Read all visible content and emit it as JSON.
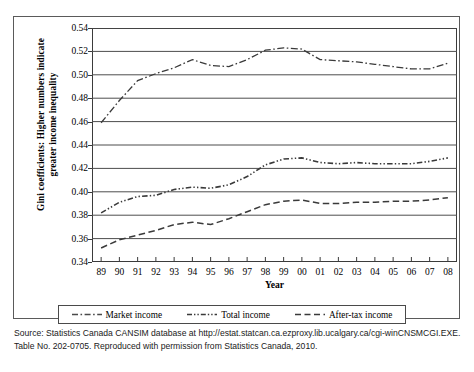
{
  "figure": {
    "y_axis_title_line1": "Gini coefficients: Higher numbers indicate",
    "y_axis_title_line2": "greater income inequality",
    "x_axis_title": "Year",
    "source_note": "Source: Statistics Canada CANSIM database at http://estat.statcan.ca.ezproxy.lib.ucalgary.ca/cgi-winCNSMCGI.EXE. Table No. 202-0705. Reproduced with permission from Statistics Canada, 2010."
  },
  "legend": {
    "items": [
      {
        "label": "Market income",
        "style": "dash-dot"
      },
      {
        "label": "Total income",
        "style": "dash-dot-dot"
      },
      {
        "label": "After-tax income",
        "style": "dash"
      }
    ]
  },
  "chart_data": {
    "type": "line",
    "title": "",
    "xlabel": "Year",
    "ylabel": "Gini coefficients: Higher numbers indicate greater income inequality",
    "categories": [
      "89",
      "90",
      "91",
      "92",
      "93",
      "94",
      "95",
      "96",
      "97",
      "98",
      "99",
      "00",
      "01",
      "02",
      "03",
      "04",
      "05",
      "06",
      "07",
      "08"
    ],
    "ylim": [
      0.34,
      0.54
    ],
    "yticks": [
      "0.34",
      "0.36",
      "0.38",
      "0.40",
      "0.42",
      "0.44",
      "0.46",
      "0.48",
      "0.50",
      "0.52",
      "0.54"
    ],
    "grid": true,
    "legend_position": "bottom",
    "series": [
      {
        "name": "Market income",
        "style": "dash-dot",
        "values": [
          0.459,
          0.478,
          0.495,
          0.501,
          0.506,
          0.513,
          0.508,
          0.507,
          0.513,
          0.521,
          0.523,
          0.522,
          0.513,
          0.512,
          0.511,
          0.509,
          0.507,
          0.505,
          0.505,
          0.51
        ]
      },
      {
        "name": "Total income",
        "style": "dash-dot-dot",
        "values": [
          0.382,
          0.391,
          0.396,
          0.397,
          0.402,
          0.404,
          0.403,
          0.406,
          0.413,
          0.423,
          0.428,
          0.429,
          0.425,
          0.424,
          0.425,
          0.424,
          0.424,
          0.424,
          0.426,
          0.429
        ]
      },
      {
        "name": "After-tax income",
        "style": "dash",
        "values": [
          0.352,
          0.359,
          0.363,
          0.367,
          0.372,
          0.374,
          0.372,
          0.377,
          0.383,
          0.389,
          0.392,
          0.393,
          0.39,
          0.39,
          0.391,
          0.391,
          0.392,
          0.392,
          0.393,
          0.395
        ]
      }
    ]
  }
}
